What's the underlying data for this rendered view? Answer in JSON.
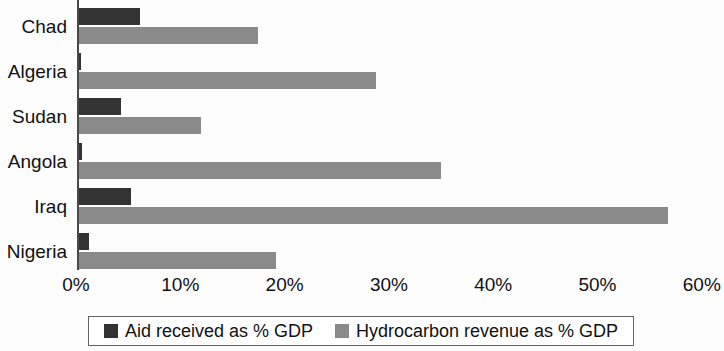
{
  "chart_data": {
    "type": "bar",
    "orientation": "horizontal",
    "title": "",
    "subtitle": "",
    "xlabel": "",
    "ylabel": "",
    "xlim": [
      0,
      60
    ],
    "grid": false,
    "legend_position": "bottom",
    "categories": [
      "Chad",
      "Algeria",
      "Sudan",
      "Angola",
      "Iraq",
      "Nigeria"
    ],
    "x_tick_labels": [
      "0%",
      "10%",
      "20%",
      "30%",
      "40%",
      "50%",
      "60%"
    ],
    "x_tick_values": [
      0,
      10,
      20,
      30,
      40,
      50,
      60
    ],
    "series": [
      {
        "name": "Aid received as % GDP",
        "color": "#333333",
        "values": [
          5.9,
          0.3,
          4.1,
          0.4,
          5.1,
          1.1
        ]
      },
      {
        "name": "Hydrocarbon revenue as % GDP",
        "color": "#8a8a8a",
        "values": [
          17.3,
          28.6,
          11.8,
          34.8,
          56.6,
          19.0
        ]
      }
    ]
  },
  "legend": {
    "entries": [
      {
        "label": "Aid received as % GDP",
        "color": "#333333"
      },
      {
        "label": "Hydrocarbon revenue as % GDP",
        "color": "#8a8a8a"
      }
    ]
  }
}
